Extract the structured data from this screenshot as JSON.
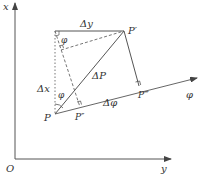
{
  "diagram": {
    "axes": {
      "vertical_label": "x",
      "horizontal_label": "y",
      "origin_label": "O"
    },
    "labels": {
      "delta_y": "Δy",
      "delta_x": "Δx",
      "delta_p": "ΔP",
      "delta_phi": "Δφ",
      "phi_axis": "φ",
      "phi_angle_top": "φ",
      "phi_angle_bottom": "φ",
      "p": "P",
      "p_prime": "P′",
      "p_double_prime": "P″",
      "p_triple_prime": "P‴"
    },
    "colors": {
      "line": "#555555",
      "text": "#333333",
      "background": "#ffffff"
    }
  }
}
